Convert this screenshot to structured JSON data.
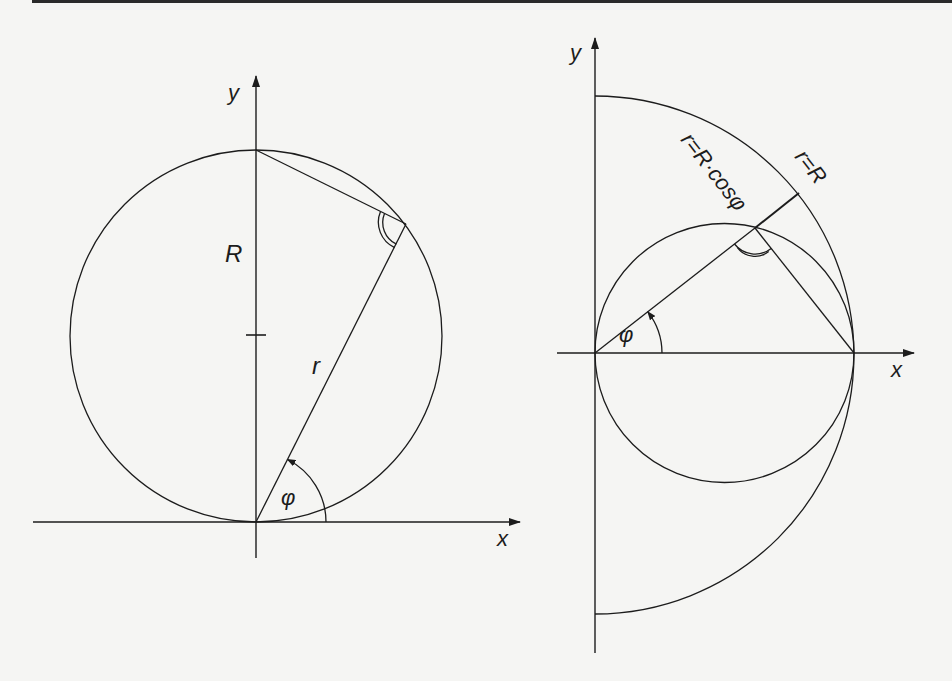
{
  "figure": {
    "left_diagram": {
      "axis_x_label": "x",
      "axis_y_label": "y",
      "radius_label": "R",
      "chord_label": "r",
      "angle_label": "φ"
    },
    "right_diagram": {
      "axis_x_label": "x",
      "axis_y_label": "y",
      "small_circle_label": "r=R·cosφ",
      "large_arc_label": "r=R",
      "angle_label": "φ"
    },
    "colors": {
      "ink": "#1c1c1c",
      "paper": "#f5f5f3"
    }
  }
}
